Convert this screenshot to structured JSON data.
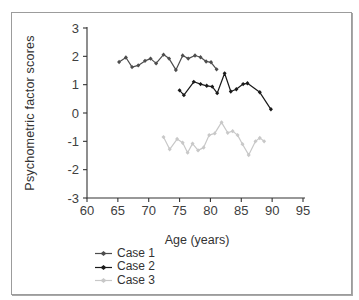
{
  "figure": {
    "background": "#ffffff",
    "border_color": "#9c9c9c"
  },
  "chart_data": {
    "type": "line",
    "title": "",
    "xlabel": "Age (years)",
    "ylabel": "Psychometric factor scores",
    "xlim": [
      60,
      95
    ],
    "ylim": [
      -3,
      3
    ],
    "x_ticks": [
      60,
      65,
      70,
      75,
      80,
      85,
      90,
      95
    ],
    "y_ticks": [
      3,
      2,
      1,
      0,
      -1,
      -2,
      -3
    ],
    "grid": false,
    "legend_position": "bottom-left",
    "axis_color": "#333333",
    "tick_label_color": "#404040",
    "series": [
      {
        "name": "Case 1",
        "color": "#4d4d4d",
        "points": [
          [
            65.2,
            1.8
          ],
          [
            66.3,
            1.96
          ],
          [
            67.3,
            1.62
          ],
          [
            68.3,
            1.68
          ],
          [
            69.4,
            1.84
          ],
          [
            70.3,
            1.92
          ],
          [
            71.2,
            1.75
          ],
          [
            72.4,
            2.06
          ],
          [
            73.3,
            1.92
          ],
          [
            74.4,
            1.52
          ],
          [
            75.5,
            2.03
          ],
          [
            76.4,
            1.92
          ],
          [
            77.5,
            2.03
          ],
          [
            78.4,
            1.97
          ],
          [
            79.3,
            1.82
          ],
          [
            80.1,
            1.79
          ],
          [
            81.0,
            1.54
          ]
        ]
      },
      {
        "name": "Case 2",
        "color": "#1a1a1a",
        "points": [
          [
            75.0,
            0.8
          ],
          [
            75.7,
            0.63
          ],
          [
            77.3,
            1.1
          ],
          [
            78.4,
            1.02
          ],
          [
            79.4,
            0.96
          ],
          [
            80.3,
            0.93
          ],
          [
            81.1,
            0.7
          ],
          [
            82.3,
            1.4
          ],
          [
            83.3,
            0.76
          ],
          [
            84.2,
            0.84
          ],
          [
            85.3,
            1.02
          ],
          [
            86.0,
            1.05
          ],
          [
            88.0,
            0.73
          ],
          [
            89.8,
            0.13
          ]
        ]
      },
      {
        "name": "Case 3",
        "color": "#c8c8c8",
        "points": [
          [
            72.4,
            -0.85
          ],
          [
            73.4,
            -1.28
          ],
          [
            74.6,
            -0.92
          ],
          [
            75.5,
            -1.05
          ],
          [
            76.3,
            -1.4
          ],
          [
            77.1,
            -1.08
          ],
          [
            78.0,
            -1.32
          ],
          [
            78.9,
            -1.22
          ],
          [
            79.8,
            -0.78
          ],
          [
            80.7,
            -0.72
          ],
          [
            81.8,
            -0.33
          ],
          [
            82.8,
            -0.7
          ],
          [
            83.6,
            -0.64
          ],
          [
            84.4,
            -0.78
          ],
          [
            85.2,
            -1.1
          ],
          [
            86.2,
            -1.48
          ],
          [
            87.3,
            -1.0
          ],
          [
            88.0,
            -0.88
          ],
          [
            88.7,
            -1.0
          ]
        ]
      }
    ]
  }
}
